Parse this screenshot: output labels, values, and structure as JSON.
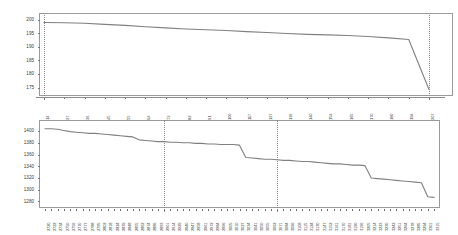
{
  "figure": {
    "background_color": "#ffffff",
    "line_color": "#808080",
    "frame_color": "#9a9a9a",
    "guide_color": "#8b8b8b"
  },
  "chart_data": [
    {
      "id": "top-chart",
      "type": "line",
      "title": "",
      "subtitle": "",
      "xlabel": "",
      "ylabel": "",
      "grid": false,
      "legend": "none",
      "ylim": [
        173,
        201
      ],
      "yticks": [
        200,
        195,
        190,
        185,
        180,
        175
      ],
      "ytick_labels": [
        "200",
        "195",
        "190",
        "185",
        "180",
        "175"
      ],
      "xtick_labels": [
        "14",
        "27",
        "36",
        "45",
        "55",
        "64",
        "73",
        "82",
        "91",
        "100",
        "117",
        "127",
        "136",
        "140",
        "154",
        "165",
        "170",
        "180",
        "194",
        "207"
      ],
      "annotations": [
        {
          "type": "vline",
          "style": "dotted",
          "x_index": 0,
          "label": "14"
        },
        {
          "type": "vline",
          "style": "dotted",
          "x_index": 19,
          "label": "207"
        }
      ],
      "series": [
        {
          "name": "series-1",
          "color": "#808080",
          "x": [
            0,
            1,
            2,
            3,
            4,
            5,
            6,
            7,
            8,
            9,
            10,
            11,
            12,
            13,
            14,
            15,
            16,
            17,
            18,
            19
          ],
          "values": [
            199.0,
            198.9,
            198.7,
            198.3,
            197.9,
            197.4,
            197.0,
            196.6,
            196.3,
            196.0,
            195.6,
            195.3,
            194.9,
            194.6,
            194.4,
            194.2,
            193.8,
            193.3,
            192.7,
            174.3
          ]
        }
      ]
    },
    {
      "id": "bottom-chart",
      "type": "line",
      "title": "",
      "subtitle": "",
      "xlabel": "",
      "ylabel": "",
      "grid": false,
      "legend": "none",
      "ylim": [
        1274,
        1412
      ],
      "yticks": [
        1400,
        1380,
        1360,
        1340,
        1320,
        1300,
        1280
      ],
      "ytick_labels": [
        "1400",
        "1380",
        "1360",
        "1340",
        "1320",
        "1300",
        "1280"
      ],
      "xtick_labels": [
        "2720",
        "2722",
        "2734",
        "2750",
        "2756",
        "2770",
        "2777",
        "2788",
        "2795",
        "2802",
        "2818",
        "2824",
        "2839",
        "2848",
        "2855",
        "2862",
        "2874",
        "2886",
        "2893",
        "2901",
        "2914",
        "2929",
        "2940",
        "2947",
        "2958",
        "2961",
        "2972",
        "2984",
        "2996",
        "3005",
        "3010",
        "3027",
        "3034",
        "3041",
        "3050",
        "3055",
        "3062",
        "3071",
        "3084",
        "3096",
        "3108",
        "3115",
        "3124",
        "3130",
        "3147",
        "3152",
        "3161",
        "3170",
        "3181",
        "3190",
        "3196",
        "3205",
        "3214",
        "3223",
        "3230",
        "3242",
        "3251",
        "3264",
        "3278",
        "3285",
        "3294",
        "3301",
        "3315"
      ],
      "annotations": [
        {
          "type": "vline",
          "style": "dotted",
          "x_index": 19,
          "label": "2901"
        },
        {
          "type": "vline",
          "style": "dotted",
          "x_index": 37,
          "label": "3071"
        }
      ],
      "series": [
        {
          "name": "series-1",
          "color": "#808080",
          "x": [
            0,
            1,
            2,
            3,
            4,
            5,
            6,
            7,
            8,
            9,
            10,
            11,
            12,
            13,
            14,
            15,
            16,
            17,
            18,
            19,
            20,
            21,
            22,
            23,
            24,
            25,
            26,
            27,
            28,
            29,
            30,
            31,
            32,
            33,
            34,
            35,
            36,
            37,
            38,
            39,
            40,
            41,
            42,
            43,
            44,
            45,
            46,
            47,
            48,
            49,
            50,
            51,
            52,
            53,
            54,
            55,
            56,
            57,
            58,
            59,
            60,
            61,
            62
          ],
          "values": [
            1404,
            1404,
            1403,
            1401,
            1399,
            1398,
            1397,
            1396,
            1396,
            1395,
            1394,
            1393,
            1392,
            1391,
            1390,
            1385,
            1384,
            1383,
            1382,
            1382,
            1381,
            1381,
            1380,
            1380,
            1379,
            1379,
            1378,
            1378,
            1377,
            1377,
            1377,
            1376,
            1355,
            1354,
            1353,
            1352,
            1352,
            1351,
            1350,
            1350,
            1349,
            1348,
            1348,
            1347,
            1346,
            1345,
            1344,
            1344,
            1343,
            1342,
            1342,
            1341,
            1320,
            1319,
            1318,
            1317,
            1316,
            1315,
            1314,
            1313,
            1312,
            1288,
            1287
          ]
        }
      ]
    }
  ]
}
